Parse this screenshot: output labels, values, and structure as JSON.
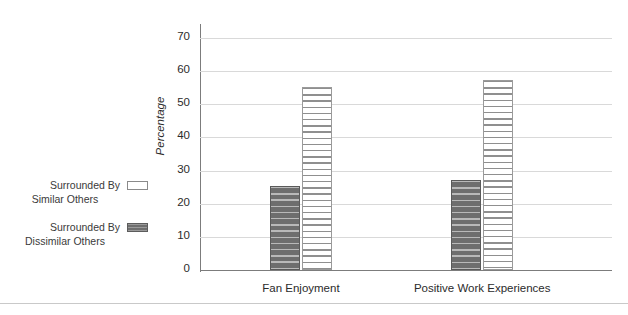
{
  "chart_data": {
    "type": "bar",
    "title": "",
    "subtitle": "",
    "xlabel": "",
    "ylabel": "Percentage",
    "categories": [
      "Fan Enjoyment",
      "Positive Work Experiences"
    ],
    "series": [
      {
        "name": "Surrounded By Dissimilar Others",
        "values": [
          25.3,
          27.3
        ],
        "color": "#6e6e6e",
        "pattern": "horizontal-stripes-dark"
      },
      {
        "name": "Surrounded By Similar Others",
        "values": [
          55.3,
          57.4
        ],
        "color": "#ffffff",
        "pattern": "horizontal-stripes-light"
      }
    ],
    "ylim": [
      0,
      75
    ],
    "yticks": [
      0,
      10,
      20,
      30,
      40,
      50,
      60,
      70
    ],
    "ytick_labels": [
      "0",
      "10",
      "20",
      "30",
      "40",
      "50",
      "60",
      "70"
    ],
    "grid": true,
    "grid_axis": "y",
    "legend_position": "left-outside",
    "axis_color": "#7c7c7c",
    "grid_color": "#d9d9d9"
  },
  "legend": {
    "entries": [
      {
        "line1": "Surrounded By",
        "line2": "Similar Others",
        "swatch": "light"
      },
      {
        "line1": "Surrounded By",
        "line2": "Dissimilar Others",
        "swatch": "dark"
      }
    ]
  },
  "axis": {
    "y_title": "Percentage",
    "ticks": [
      "70",
      "60",
      "50",
      "40",
      "30",
      "20",
      "10",
      "0"
    ]
  },
  "categories": {
    "first": "Fan Enjoyment",
    "second": "Positive Work Experiences"
  }
}
